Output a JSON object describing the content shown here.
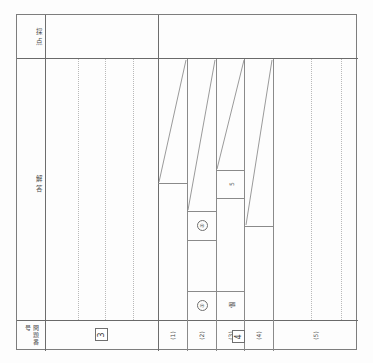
{
  "document": {
    "kind": "japanese-exam-answer-sheet-grading-grid",
    "row_labels": {
      "grading": "採点",
      "answer": "解答",
      "question_number": "問題番号"
    },
    "question_numbers": [
      {
        "label": "3"
      },
      {
        "label": "4"
      }
    ],
    "sub_questions": [
      {
        "label": "(1)"
      },
      {
        "label": "(2)"
      },
      {
        "label": "(3)"
      },
      {
        "label": "(4)"
      },
      {
        "label": "(5)"
      }
    ],
    "answer_marks": [
      {
        "label": "①"
      },
      {
        "label": "②"
      },
      {
        "label": "①"
      },
      {
        "label": "5"
      },
      {
        "label": "個"
      }
    ],
    "colors": {
      "rule": "#8a8a8a",
      "heavy_rule": "#6a6a6a",
      "dotted_rule": "#b9b9b9",
      "ink": "#474747",
      "paper": "#fdfdfd"
    }
  }
}
